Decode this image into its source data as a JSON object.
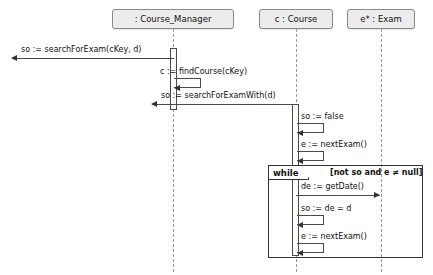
{
  "diagram": {
    "kind": "uml-sequence-diagram",
    "background_color": "#ffffff",
    "line_color": "#4a4a4a",
    "head_fill_color": "#ececec"
  },
  "lifelines": [
    {
      "id": "course_manager",
      "label": ": Course_Manager",
      "x": 173
    },
    {
      "id": "course",
      "label": "c : Course",
      "x": 296
    },
    {
      "id": "exam",
      "label": "e* : Exam",
      "x": 381
    }
  ],
  "messages": [
    {
      "id": "m1",
      "label": "so := searchForExam(cKey, d)",
      "direction": "left",
      "kind": "return"
    },
    {
      "id": "m2",
      "label": "c := findCourse(cKey)",
      "direction": "self",
      "kind": "self"
    },
    {
      "id": "m3",
      "label": "so := searchForExamWith(d)",
      "direction": "left",
      "kind": "return"
    },
    {
      "id": "m4",
      "label": "so := false",
      "direction": "self",
      "kind": "self"
    },
    {
      "id": "m5",
      "label": "e := nextExam()",
      "direction": "self",
      "kind": "self"
    },
    {
      "id": "m6",
      "label": "de := getDate()",
      "direction": "right",
      "kind": "call"
    },
    {
      "id": "m7",
      "label": "so := de = d",
      "direction": "self",
      "kind": "self"
    },
    {
      "id": "m8",
      "label": "e := nextExam()",
      "direction": "self",
      "kind": "self"
    }
  ],
  "fragment": {
    "operator": "while",
    "guard": "[not so and e ≠ null]"
  }
}
